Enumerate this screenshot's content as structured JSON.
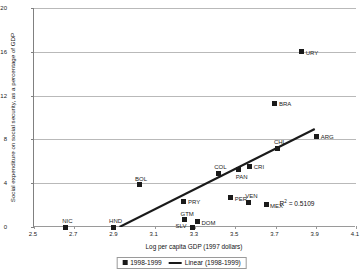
{
  "chart_data": {
    "type": "scatter",
    "title": "",
    "xlabel": "Log per capita GDP (1997 dollars)",
    "ylabel": "Social expenditure on social security, as a percentage of GDP",
    "xlim": [
      2.5,
      4.1
    ],
    "ylim": [
      0,
      20
    ],
    "xticks": [
      "2.5",
      "2.7",
      "2.9",
      "3.1",
      "3.3",
      "3.5",
      "3.7",
      "3.9",
      "4.1"
    ],
    "xtick_values": [
      2.5,
      2.7,
      2.9,
      3.1,
      3.3,
      3.5,
      3.7,
      3.9,
      4.1
    ],
    "yticks": [
      "0",
      "4",
      "8",
      "12",
      "16",
      "20"
    ],
    "ytick_values": [
      0,
      4,
      8,
      12,
      16,
      20
    ],
    "grid": "horizontal",
    "legend_position": "bottom",
    "annotations": [
      {
        "text": "R² = 0.5109",
        "r2_value": 0.5109,
        "x": 3.72,
        "y": 2.55
      }
    ],
    "series": [
      {
        "name": "1998-1999",
        "type": "scatter",
        "marker": "square",
        "color": "#1a1a1a",
        "points": [
          {
            "label": "NIC",
            "x": 2.655,
            "y": 0.0,
            "label_dx": -3,
            "label_dy": -9
          },
          {
            "label": "HND",
            "x": 2.893,
            "y": 0.0,
            "label_dx": -4,
            "label_dy": -9
          },
          {
            "label": "BOL",
            "x": 3.022,
            "y": 3.85,
            "label_dx": -4,
            "label_dy": -9
          },
          {
            "label": "GTM",
            "x": 3.248,
            "y": 0.65,
            "label_dx": -4,
            "label_dy": -9
          },
          {
            "label": "SLV",
            "x": 3.288,
            "y": 0.0,
            "label_dx": -17,
            "label_dy": -4
          },
          {
            "label": "PRY",
            "x": 3.245,
            "y": 2.37,
            "label_dx": 4,
            "label_dy": -2
          },
          {
            "label": "DOM",
            "x": 3.312,
            "y": 0.47,
            "label_dx": 4,
            "label_dy": -2
          },
          {
            "label": "COL",
            "x": 3.415,
            "y": 4.9,
            "label_dx": -4,
            "label_dy": -9
          },
          {
            "label": "PER",
            "x": 3.478,
            "y": 2.68,
            "label_dx": 4,
            "label_dy": -2
          },
          {
            "label": "VEN",
            "x": 3.565,
            "y": 2.28,
            "label_dx": -3,
            "label_dy": -9
          },
          {
            "label": "PAN",
            "x": 3.517,
            "y": 5.25,
            "label_dx": -3,
            "label_dy": 4
          },
          {
            "label": "CRI",
            "x": 3.572,
            "y": 5.55,
            "label_dx": 4,
            "label_dy": -2
          },
          {
            "label": "MEX",
            "x": 3.653,
            "y": 2.03,
            "label_dx": 4,
            "label_dy": -2
          },
          {
            "label": "CHL",
            "x": 3.712,
            "y": 7.2,
            "label_dx": -4,
            "label_dy": -9
          },
          {
            "label": "BRA",
            "x": 3.697,
            "y": 11.3,
            "label_dx": 4,
            "label_dy": -2
          },
          {
            "label": "URY",
            "x": 3.83,
            "y": 16.0,
            "label_dx": 4,
            "label_dy": -2
          },
          {
            "label": "ARG",
            "x": 3.905,
            "y": 8.3,
            "label_dx": 4,
            "label_dy": -2
          }
        ]
      },
      {
        "name": "Linear (1998-1999)",
        "type": "line",
        "color": "#1a1a1a",
        "fit": "linear",
        "x_start": 2.925,
        "y_start": 0.0,
        "x_end": 3.895,
        "y_end": 8.95
      }
    ]
  },
  "legend": {
    "items": [
      {
        "label": "1998-1999",
        "marker": "square-marker"
      },
      {
        "label": "Linear (1998-1999)",
        "marker": "line-marker"
      }
    ]
  }
}
